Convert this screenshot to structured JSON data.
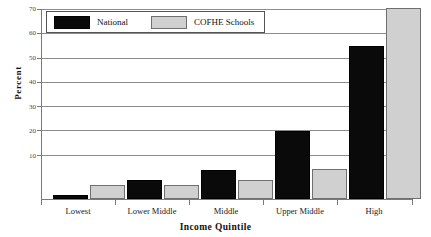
{
  "chart_data": {
    "type": "bar",
    "title": "",
    "xlabel": "Income Quintile",
    "ylabel": "Percent",
    "categories": [
      "Lowest",
      "Lower Middle",
      "Middle",
      "Upper Middle",
      "High"
    ],
    "series": [
      {
        "name": "National",
        "color": "#0a0a0a",
        "values": [
          1.5,
          7.0,
          10.8,
          25.0,
          56.0
        ]
      },
      {
        "name": "COFHE Schools",
        "color": "#d0d0d0",
        "values": [
          5.0,
          5.0,
          7.0,
          11.0,
          70.0
        ]
      }
    ],
    "ylim": [
      0,
      70
    ],
    "yticks": [
      10,
      20,
      30,
      40,
      50,
      60,
      70
    ],
    "ytick_labels": [
      "10",
      "20",
      "30",
      "40",
      "50",
      "60",
      "70"
    ],
    "grid": true,
    "legend_position": "top-left"
  },
  "axes": {
    "y_title": "Percent",
    "x_title": "Income Quintile",
    "y_labels": {
      "t70": "70",
      "t60": "60",
      "t50": "50",
      "t40": "40",
      "t30": "30",
      "t20": "20",
      "t10": "10"
    },
    "x_labels": {
      "c0": "Lowest",
      "c1": "Lower Middle",
      "c2": "Middle",
      "c3": "Upper Middle",
      "c4": "High"
    }
  },
  "legend": {
    "entries": [
      {
        "label": "National",
        "swatch": "black-swatch"
      },
      {
        "label": "COFHE Schools",
        "swatch": "gray-swatch"
      }
    ]
  }
}
